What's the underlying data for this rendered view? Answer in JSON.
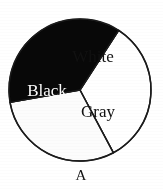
{
  "figure": {
    "caption": "A",
    "background_color": "#ffffff",
    "outline_color": "#1a1a1a"
  },
  "chart_data": {
    "type": "pie",
    "title": "",
    "subtitle": "",
    "xlabel": "",
    "ylabel": "",
    "legend_position": "none",
    "grid": false,
    "labels_inside_slices": true,
    "categories": [
      "White",
      "Gray",
      "Black"
    ],
    "values": [
      33,
      30,
      37
    ],
    "units": "percent",
    "slices": [
      {
        "label": "White",
        "value": 33,
        "fill_color": "#ffffff",
        "label_color": "#111111",
        "start_angle_deg": -57,
        "end_angle_deg": 62,
        "label_x": 93,
        "label_y": 62
      },
      {
        "label": "Gray",
        "value": 30,
        "fill_color": "#fcfcfc",
        "label_color": "#111111",
        "start_angle_deg": 62,
        "end_angle_deg": 170,
        "label_x": 98,
        "label_y": 117
      },
      {
        "label": "Black",
        "value": 37,
        "fill_color": "#080808",
        "label_color": "#fdfdfd",
        "start_angle_deg": 170,
        "end_angle_deg": 303,
        "label_x": 47,
        "label_y": 96
      }
    ],
    "geometry": {
      "center_x": 80,
      "center_y": 90,
      "radius": 71
    }
  }
}
